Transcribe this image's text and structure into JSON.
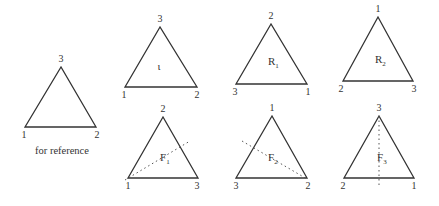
{
  "reference": {
    "caption": "for reference",
    "vertices": {
      "top": "3",
      "left": "1",
      "right": "2"
    }
  },
  "rotations": [
    {
      "name": "ι",
      "sub": "",
      "vertices": {
        "top": "3",
        "left": "1",
        "right": "2"
      }
    },
    {
      "name": "R",
      "sub": "1",
      "vertices": {
        "top": "2",
        "left": "3",
        "right": "1"
      }
    },
    {
      "name": "R",
      "sub": "2",
      "vertices": {
        "top": "1",
        "left": "2",
        "right": "3"
      }
    }
  ],
  "reflections": [
    {
      "name": "F",
      "sub": "1",
      "vertices": {
        "top": "2",
        "left": "1",
        "right": "3"
      },
      "axis": "through vertex 1 (bottom-left)"
    },
    {
      "name": "F",
      "sub": "2",
      "vertices": {
        "top": "1",
        "left": "3",
        "right": "2"
      },
      "axis": "through vertex 2 (bottom-right)"
    },
    {
      "name": "F",
      "sub": "3",
      "vertices": {
        "top": "3",
        "left": "2",
        "right": "1"
      },
      "axis": "vertical through vertex 3 (top)"
    }
  ]
}
